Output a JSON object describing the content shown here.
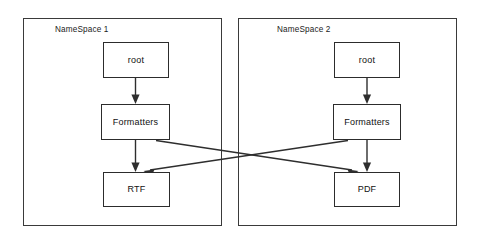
{
  "diagram": {
    "background_color": "#ffffff",
    "stroke_color": "#2e2e2e",
    "container_stroke_color": "#3a3a3a",
    "node_fill_color": "#ffffff",
    "text_color": "#111111"
  },
  "namespaces": [
    {
      "id": "namespace-1",
      "label": "NameSpace 1",
      "nodes": [
        {
          "id": "root-1",
          "label": "root"
        },
        {
          "id": "formatters-1",
          "label": "Formatters"
        },
        {
          "id": "leaf-1",
          "label": "RTF"
        }
      ]
    },
    {
      "id": "namespace-2",
      "label": "NameSpace 2",
      "nodes": [
        {
          "id": "root-2",
          "label": "root"
        },
        {
          "id": "formatters-2",
          "label": "Formatters"
        },
        {
          "id": "leaf-2",
          "label": "PDF"
        }
      ]
    }
  ],
  "edges": [
    {
      "id": "edge-root1-formatters1",
      "from": "root-1",
      "to": "formatters-1",
      "kind": "vertical"
    },
    {
      "id": "edge-formatters1-rtf",
      "from": "formatters-1",
      "to": "leaf-1",
      "kind": "vertical"
    },
    {
      "id": "edge-root2-formatters2",
      "from": "root-2",
      "to": "formatters-2",
      "kind": "vertical"
    },
    {
      "id": "edge-formatters2-pdf",
      "from": "formatters-2",
      "to": "leaf-2",
      "kind": "vertical"
    },
    {
      "id": "edge-formatters1-pdf",
      "from": "formatters-1",
      "to": "leaf-2",
      "kind": "cross"
    },
    {
      "id": "edge-formatters2-rtf",
      "from": "formatters-2",
      "to": "leaf-1",
      "kind": "cross"
    }
  ]
}
